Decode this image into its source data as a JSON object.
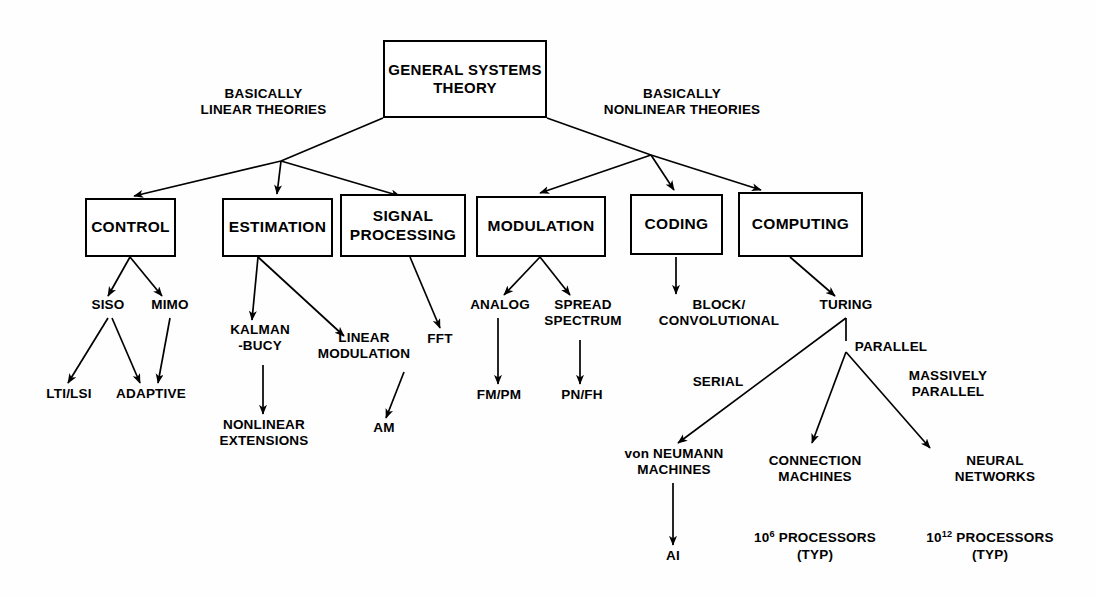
{
  "diagram": {
    "title_node": {
      "label": "GENERAL\nSYSTEMS\nTHEORY"
    },
    "branch_labels": [
      {
        "name": "linear",
        "text": "BASICALLY\nLINEAR THEORIES"
      },
      {
        "name": "nonlinear",
        "text": "BASICALLY\nNONLINEAR THEORIES"
      }
    ],
    "level2_boxes": [
      {
        "name": "control",
        "label": "CONTROL"
      },
      {
        "name": "estimation",
        "label": "ESTIMATION"
      },
      {
        "name": "signal-processing",
        "label": "SIGNAL\nPROCESSING"
      },
      {
        "name": "modulation",
        "label": "MODULATION"
      },
      {
        "name": "coding",
        "label": "CODING"
      },
      {
        "name": "computing",
        "label": "COMPUTING"
      }
    ],
    "level3_leaves": [
      {
        "name": "siso",
        "label": "SISO"
      },
      {
        "name": "mimo",
        "label": "MIMO"
      },
      {
        "name": "kalman-bucy",
        "label": "KALMAN\n-BUCY"
      },
      {
        "name": "linear-modulation",
        "label": "LINEAR\nMODULATION"
      },
      {
        "name": "fft",
        "label": "FFT"
      },
      {
        "name": "analog",
        "label": "ANALOG"
      },
      {
        "name": "spread-spectrum",
        "label": "SPREAD\nSPECTRUM"
      },
      {
        "name": "block-convolutional",
        "label": "BLOCK/\nCONVOLUTIONAL"
      },
      {
        "name": "turing",
        "label": "TURING"
      }
    ],
    "level4_leaves": [
      {
        "name": "lti-lsi",
        "label": "LTI/LSI"
      },
      {
        "name": "adaptive",
        "label": "ADAPTIVE"
      },
      {
        "name": "nonlinear-extensions",
        "label": "NONLINEAR\nEXTENSIONS"
      },
      {
        "name": "am",
        "label": "AM"
      },
      {
        "name": "fm-pm",
        "label": "FM/PM"
      },
      {
        "name": "pn-fh",
        "label": "PN/FH"
      }
    ],
    "turing_edge_labels": [
      {
        "name": "serial",
        "text": "SERIAL"
      },
      {
        "name": "parallel",
        "text": "PARALLEL"
      },
      {
        "name": "massively-parallel",
        "text": "MASSIVELY\nPARALLEL"
      }
    ],
    "computing_leaves": [
      {
        "name": "von-neumann-machines",
        "label": "von NEUMANN\nMACHINES",
        "note": ""
      },
      {
        "name": "connection-machines",
        "label": "CONNECTION\nMACHINES",
        "note_prefix": "10",
        "note_exp": "6",
        "note_suffix": " PROCESSORS\n(TYP)"
      },
      {
        "name": "neural-networks",
        "label": "NEURAL\nNETWORKS",
        "note_prefix": "10",
        "note_exp": "12",
        "note_suffix": " PROCESSORS\n(TYP)"
      }
    ],
    "terminal_leaf": {
      "name": "ai",
      "label": "AI"
    },
    "colors": {
      "stroke": "#000000",
      "background": "#ffffff",
      "text": "#000000"
    }
  }
}
